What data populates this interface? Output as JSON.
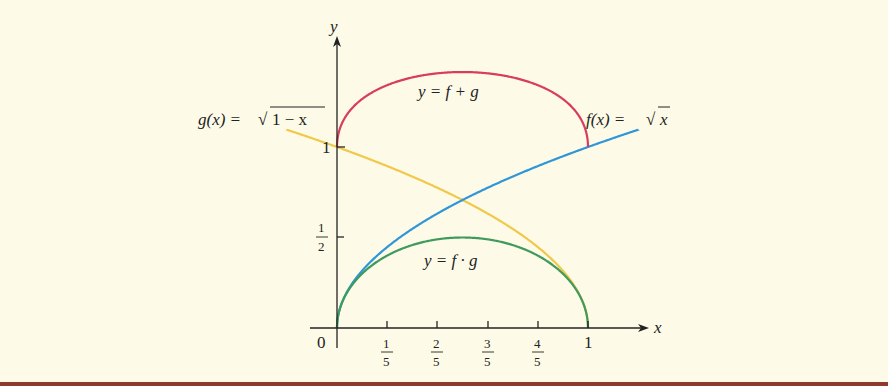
{
  "colors": {
    "background": "#fdfbe8",
    "axes": "#222222",
    "f_plus_g": "#d83c5e",
    "f": "#2f96d8",
    "g": "#f0c84a",
    "f_times_g": "#3f9a5c",
    "border": "#8e3b2c"
  },
  "axes": {
    "x_label": "x",
    "y_label": "y",
    "origin_label": "0",
    "x_ticks": [
      {
        "num": "1",
        "den": "5",
        "value": 0.2
      },
      {
        "num": "2",
        "den": "5",
        "value": 0.4
      },
      {
        "num": "3",
        "den": "5",
        "value": 0.6
      },
      {
        "num": "4",
        "den": "5",
        "value": 0.8
      }
    ],
    "x_tick_one": "1",
    "y_ticks": [
      {
        "num": "1",
        "den": "2",
        "value": 0.5
      }
    ],
    "y_tick_one": "1"
  },
  "labels": {
    "g": {
      "lhs": "g(x) = ",
      "radicand": "1 − x"
    },
    "f": {
      "lhs": "f(x) = ",
      "radicand": "x"
    },
    "sum": "y = f + g",
    "product": "y = f · g"
  },
  "chart_data": {
    "type": "line",
    "title": "",
    "xlabel": "x",
    "ylabel": "y",
    "xlim": [
      -0.2,
      1.2
    ],
    "ylim": [
      0,
      1.6
    ],
    "x_ticks": [
      "0",
      "1/5",
      "2/5",
      "3/5",
      "4/5",
      "1"
    ],
    "y_ticks": [
      "1/2",
      "1"
    ],
    "series": [
      {
        "name": "g(x) = √(1 − x)",
        "domain": [
          -0.2,
          1
        ],
        "color": "#f0c84a",
        "x": [
          -0.2,
          0,
          0.2,
          0.4,
          0.6,
          0.8,
          1.0
        ],
        "values": [
          1.095,
          1.0,
          0.894,
          0.775,
          0.632,
          0.447,
          0.0
        ]
      },
      {
        "name": "f(x) = √x",
        "domain": [
          0,
          1.2
        ],
        "color": "#2f96d8",
        "x": [
          0,
          0.2,
          0.4,
          0.6,
          0.8,
          1.0,
          1.2
        ],
        "values": [
          0.0,
          0.447,
          0.632,
          0.775,
          0.894,
          1.0,
          1.095
        ]
      },
      {
        "name": "y = f + g",
        "domain": [
          0,
          1
        ],
        "color": "#d83c5e",
        "x": [
          0,
          0.2,
          0.4,
          0.5,
          0.6,
          0.8,
          1.0
        ],
        "values": [
          1.0,
          1.342,
          1.407,
          1.414,
          1.407,
          1.342,
          1.0
        ]
      },
      {
        "name": "y = f · g",
        "domain": [
          0,
          1
        ],
        "color": "#3f9a5c",
        "x": [
          0,
          0.2,
          0.4,
          0.5,
          0.6,
          0.8,
          1.0
        ],
        "values": [
          0.0,
          0.4,
          0.49,
          0.5,
          0.49,
          0.4,
          0.0
        ]
      }
    ]
  }
}
